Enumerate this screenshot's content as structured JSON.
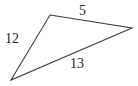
{
  "figure": {
    "kind": "geometry-triangle-diagram",
    "background_color": "#ffffff",
    "stroke_color": "#3a3a3a",
    "text_color": "#231f20",
    "stroke_width": 1.1,
    "canvas": {
      "width": 138,
      "height": 86
    },
    "vertices": [
      {
        "name": "apex",
        "x": 50,
        "y": 15
      },
      {
        "name": "right",
        "x": 132,
        "y": 28
      },
      {
        "name": "bottom-left",
        "x": 11,
        "y": 80
      }
    ],
    "sides": [
      {
        "name": "top-right-side",
        "label": "5",
        "from": "apex",
        "to": "right",
        "label_x": 79,
        "label_y": 4
      },
      {
        "name": "bottom-side",
        "label": "13",
        "from": "right",
        "to": "bottom-left",
        "label_x": 70,
        "label_y": 57
      },
      {
        "name": "left-side",
        "label": "12",
        "from": "bottom-left",
        "to": "apex",
        "label_x": 5,
        "label_y": 32
      }
    ],
    "path": "M 50 15 L 132 28 L 11 80 Z"
  }
}
